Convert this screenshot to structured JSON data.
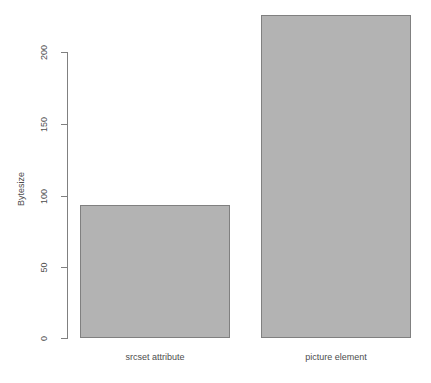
{
  "chart_data": {
    "type": "bar",
    "title": "",
    "xlabel": "",
    "ylabel": "Bytesize",
    "categories": [
      "srcset attribute",
      "picture element"
    ],
    "values": [
      93,
      226
    ],
    "ylim": [
      0,
      230
    ],
    "yticks": [
      0,
      50,
      100,
      150,
      200
    ],
    "ytick_labels": [
      "0",
      "50",
      "100",
      "150",
      "200"
    ],
    "grid": false,
    "legend": null,
    "colors": {
      "bar_fill": "#b3b3b3",
      "bar_border": "#808080",
      "axis": "#808080",
      "text": "#4d4d4d",
      "background": "#ffffff"
    }
  },
  "axis": {
    "y_title": "Bytesize",
    "ticks": [
      {
        "label": "200",
        "value": 200
      },
      {
        "label": "150",
        "value": 150
      },
      {
        "label": "100",
        "value": 100
      },
      {
        "label": "50",
        "value": 50
      },
      {
        "label": "0",
        "value": 0
      }
    ]
  },
  "bars": [
    {
      "label": "srcset attribute",
      "value": 93
    },
    {
      "label": "picture element",
      "value": 226
    }
  ]
}
